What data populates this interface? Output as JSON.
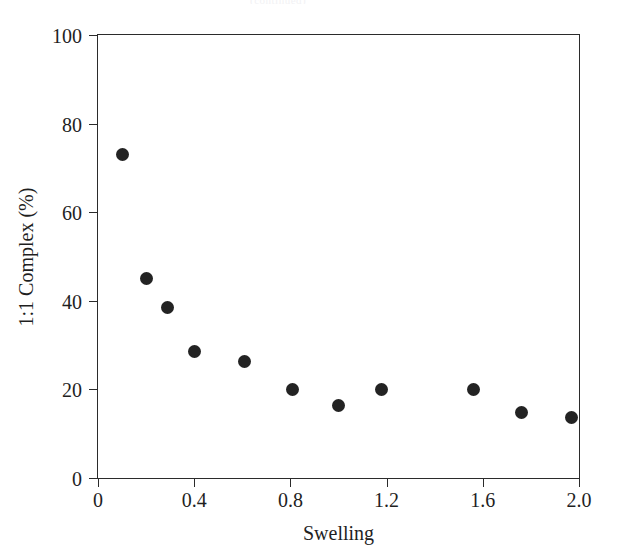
{
  "figure": {
    "background_color": "#ffffff",
    "frame_color": "#2b2b2b",
    "marker_color": "#232323",
    "caption_remnant": "(continued)"
  },
  "chart_data": {
    "type": "scatter",
    "title": "",
    "subtitle": "",
    "xlabel": "Swelling",
    "ylabel": "1:1 Complex (%)",
    "xlim": [
      0,
      2.0
    ],
    "ylim": [
      0,
      100
    ],
    "xticks": [
      0,
      0.4,
      0.8,
      1.2,
      1.6,
      2.0
    ],
    "xtick_labels": [
      "0",
      "0.4",
      "0.8",
      "1.2",
      "1.6",
      "2.0"
    ],
    "yticks": [
      0,
      20,
      40,
      60,
      80,
      100
    ],
    "ytick_labels": [
      "0",
      "20",
      "40",
      "60",
      "80",
      "100"
    ],
    "grid": false,
    "legend": null,
    "legend_position": "none",
    "marker": "filled-circle",
    "marker_size_px": 13,
    "series": [
      {
        "name": "1:1 Complex vs Swelling",
        "x": [
          0.1,
          0.2,
          0.29,
          0.4,
          0.61,
          0.81,
          1.0,
          1.18,
          1.56,
          1.76,
          1.97
        ],
        "y": [
          73.0,
          45.0,
          38.5,
          28.5,
          26.2,
          20.0,
          16.4,
          20.0,
          20.0,
          14.8,
          13.6
        ]
      }
    ]
  }
}
